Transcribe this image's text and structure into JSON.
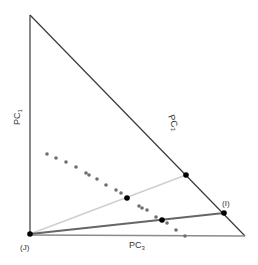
{
  "diagram": {
    "type": "ternary-projection",
    "colors": {
      "edge_dark": "#3a3a3a",
      "edge_bottom": "#8a8a8a",
      "line_light": "#cfcfcf",
      "line_mid": "#666666",
      "dot_gray": "#6e6e6e",
      "dot_black": "#000000"
    },
    "labels": {
      "pc1": "PC",
      "pc1_sub": "1",
      "pc2": "PC",
      "pc2_sub": "2",
      "pc3": "PC",
      "pc3_sub": "3",
      "vertex_j": "(J)",
      "vertex_i": "(I)"
    },
    "triangle": {
      "top": [
        30,
        15
      ],
      "bottom_left": [
        30,
        234
      ],
      "bottom_right": [
        245,
        236
      ]
    },
    "lines": [
      {
        "name": "light-line",
        "from": [
          30,
          234
        ],
        "to": [
          186,
          175
        ]
      },
      {
        "name": "dark-line",
        "from": [
          30,
          234
        ],
        "to": [
          224,
          213
        ]
      }
    ],
    "black_points": [
      [
        30,
        234
      ],
      [
        127,
        198
      ],
      [
        162,
        220
      ],
      [
        186,
        175
      ],
      [
        224,
        213
      ]
    ],
    "gray_points": [
      [
        47,
        154
      ],
      [
        56,
        158
      ],
      [
        66,
        162
      ],
      [
        76,
        167
      ],
      [
        86,
        173
      ],
      [
        89,
        175
      ],
      [
        97,
        179
      ],
      [
        106,
        185
      ],
      [
        116,
        190
      ],
      [
        121,
        193
      ],
      [
        139,
        206
      ],
      [
        142,
        208
      ],
      [
        147,
        210
      ],
      [
        156,
        217
      ],
      [
        167,
        223
      ],
      [
        176,
        230
      ],
      [
        185,
        236
      ]
    ]
  }
}
